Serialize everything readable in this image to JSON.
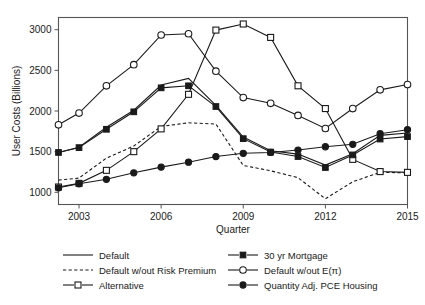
{
  "chart_data": {
    "type": "line",
    "title": "",
    "xlabel": "Quarter",
    "ylabel": "User Costs (Billions)",
    "xlim": [
      2002.25,
      2015.0
    ],
    "ylim": [
      850,
      3150
    ],
    "xticks": [
      2003,
      2006,
      2009,
      2012,
      2015
    ],
    "xtick_labels": [
      "2003",
      "2006",
      "2009",
      "2012",
      "2015"
    ],
    "yticks": [
      1000,
      1500,
      2000,
      2500,
      3000
    ],
    "ytick_labels": [
      "1000",
      "1500",
      "2000",
      "2500",
      "3000"
    ],
    "grid": false,
    "legend_position": "below-plot",
    "x": [
      2002.25,
      2003.0,
      2004.0,
      2005.0,
      2006.0,
      2007.0,
      2008.0,
      2009.0,
      2010.0,
      2011.0,
      2012.0,
      2013.0,
      2014.0,
      2015.0
    ],
    "series": [
      {
        "name": "Default",
        "marker": "none",
        "linestyle": "solid",
        "color": "#1a1a1a",
        "values": [
          1490,
          1555,
          1800,
          2010,
          2320,
          2400,
          2070,
          1680,
          1510,
          1470,
          1335,
          1475,
          1700,
          1730
        ]
      },
      {
        "name": "Default w/out Risk Premium",
        "marker": "none",
        "linestyle": "dashed",
        "color": "#1a1a1a",
        "values": [
          1150,
          1175,
          1420,
          1570,
          1810,
          1855,
          1840,
          1330,
          1265,
          1180,
          920,
          1130,
          1245,
          1240
        ]
      },
      {
        "name": "Alternative",
        "marker": "open-square",
        "linestyle": "solid",
        "color": "#1a1a1a",
        "values": [
          1065,
          1110,
          1270,
          1500,
          1780,
          2205,
          2995,
          3070,
          2905,
          2310,
          2030,
          1405,
          1255,
          1245
        ]
      },
      {
        "name": "30 yr Mortgage",
        "marker": "filled-square",
        "linestyle": "solid",
        "color": "#1a1a1a",
        "values": [
          1490,
          1550,
          1775,
          1990,
          2285,
          2310,
          2055,
          1660,
          1495,
          1440,
          1305,
          1460,
          1655,
          1685
        ]
      },
      {
        "name": "Default w/out E(π)",
        "marker": "open-circle",
        "linestyle": "solid",
        "color": "#1a1a1a",
        "values": [
          1830,
          1975,
          2310,
          2570,
          2935,
          2950,
          2490,
          2165,
          2095,
          1945,
          1785,
          2030,
          2260,
          2325
        ]
      },
      {
        "name": "Quantity Adj. PCE Housing",
        "marker": "filled-circle",
        "linestyle": "solid",
        "color": "#1a1a1a",
        "values": [
          1055,
          1105,
          1160,
          1240,
          1310,
          1370,
          1440,
          1480,
          1490,
          1520,
          1560,
          1590,
          1720,
          1770
        ]
      }
    ]
  },
  "legend": {
    "entries": [
      {
        "label": "Default",
        "marker": "none",
        "linestyle": "solid"
      },
      {
        "label": "30 yr Mortgage",
        "marker": "filled-square",
        "linestyle": "solid"
      },
      {
        "label": "Default w/out Risk Premium",
        "marker": "none",
        "linestyle": "dashed"
      },
      {
        "label": "Default w/out E(π)",
        "marker": "open-circle",
        "linestyle": "solid"
      },
      {
        "label": "Alternative",
        "marker": "open-square",
        "linestyle": "solid"
      },
      {
        "label": "Quantity Adj. PCE Housing",
        "marker": "filled-circle",
        "linestyle": "solid"
      }
    ]
  }
}
